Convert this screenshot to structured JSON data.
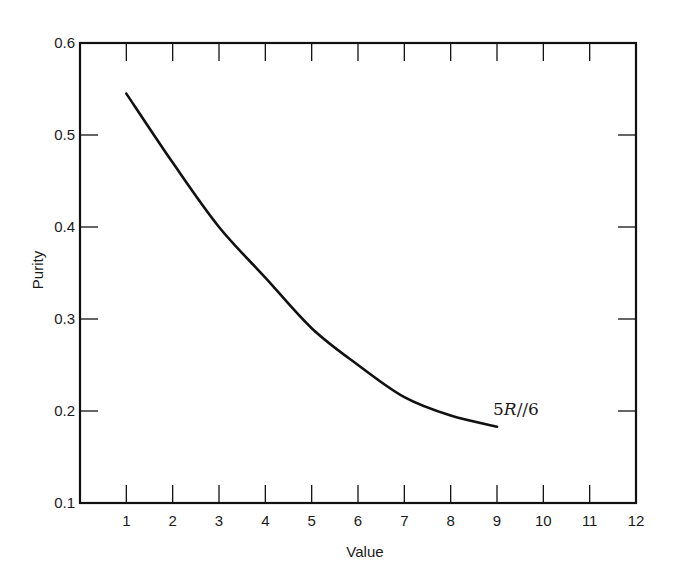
{
  "chart_data": {
    "type": "line",
    "title": "",
    "xlabel": "Value",
    "ylabel": "Purity",
    "xlim": [
      0,
      12
    ],
    "ylim": [
      0.1,
      0.6
    ],
    "x_ticks": [
      1,
      2,
      3,
      4,
      5,
      6,
      7,
      8,
      9,
      10,
      11,
      12
    ],
    "y_ticks": [
      0.1,
      0.2,
      0.3,
      0.4,
      0.5,
      0.6
    ],
    "x_tick_labels": [
      "1",
      "2",
      "3",
      "4",
      "5",
      "6",
      "7",
      "8",
      "9",
      "10",
      "11",
      "12"
    ],
    "y_tick_labels": [
      "0.1",
      "0.2",
      "0.3",
      "0.4",
      "0.5",
      "0.6"
    ],
    "grid": false,
    "legend": null,
    "series": [
      {
        "name": "5R//6",
        "x": [
          1,
          2,
          3,
          4,
          5,
          6,
          7,
          8,
          9
        ],
        "values": [
          0.545,
          0.47,
          0.4,
          0.345,
          0.29,
          0.25,
          0.215,
          0.195,
          0.183
        ]
      }
    ],
    "annotations": [
      {
        "text": "5R//6",
        "x": 9.1,
        "y": 0.2
      }
    ]
  },
  "labels": {
    "xlabel": "Value",
    "ylabel": "Purity",
    "curve_label_prefix": "5",
    "curve_label_italic": "R",
    "curve_label_suffix": "//6"
  }
}
